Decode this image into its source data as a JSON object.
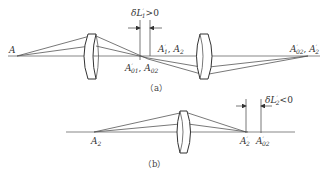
{
  "figure_a": {
    "caption": "（a）",
    "object_label": "A",
    "annotation": "δL′₁>0",
    "annotation_parts": {
      "prefix": "δL",
      "sup": "′",
      "sub": "1",
      "relation": ">0"
    },
    "label_image1_paraxial": "A′01, A02",
    "label_image1_paraxial_parts": {
      "base1": "A",
      "sup1": "′",
      "sub1": "01",
      "sep": ", ",
      "base2": "A",
      "sub2": "02"
    },
    "label_image1_marginal": "A′1, A2",
    "label_image1_marginal_parts": {
      "base1": "A",
      "sup1": "′",
      "sub1": "1",
      "sep": ", ",
      "base2": "A",
      "sub2": "2"
    },
    "label_image2": "A′02, A′2",
    "label_image2_parts": {
      "base1": "A",
      "sup1": "′",
      "sub1": "02",
      "sep": ", ",
      "base2": "A",
      "sup2": "′",
      "sub2": "2"
    }
  },
  "figure_b": {
    "caption": "（b）",
    "object_label": "A2",
    "object_label_parts": {
      "base": "A",
      "sub": "2"
    },
    "annotation": "δL′₂<0",
    "annotation_parts": {
      "prefix": "δL",
      "sup": "′",
      "sub": "2",
      "relation": "<0"
    },
    "label_marginal_image": "A′2",
    "label_marginal_image_parts": {
      "base": "A",
      "sup": "′",
      "sub": "2"
    },
    "label_paraxial_image": "A′02",
    "label_paraxial_image_parts": {
      "base": "A",
      "sup": "′",
      "sub": "02"
    }
  }
}
